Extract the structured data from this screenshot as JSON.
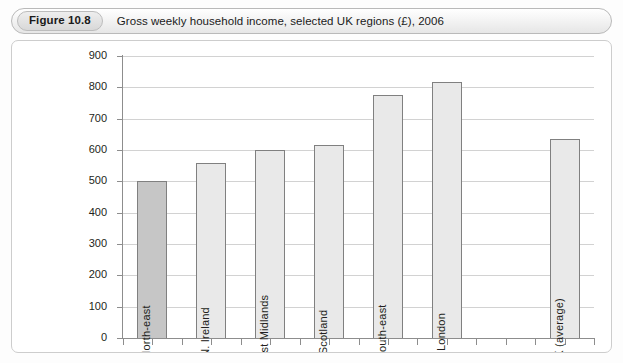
{
  "figure": {
    "tag": "Figure 10.8",
    "caption": "Gross weekly household income, selected UK regions (£), 2006"
  },
  "colors": {
    "bar_highlight_fill": "#c6c6c6",
    "bar_fill": "#e9e9e9",
    "bar_stroke": "#808080",
    "gridline": "#d2d2d2",
    "axis": "#8d8d8d",
    "text": "#231f20",
    "panel_border": "#cdcdcd"
  },
  "chart_data": {
    "type": "bar",
    "title": "Gross weekly household income, selected UK regions (£), 2006",
    "xlabel": "",
    "ylabel": "",
    "ylim": [
      0,
      900
    ],
    "ytick_step": 100,
    "yticks": [
      "900",
      "800",
      "700",
      "600",
      "500",
      "400",
      "300",
      "200",
      "100",
      "0"
    ],
    "grid": true,
    "legend": "none",
    "categories": [
      "North-east",
      "N. Ireland",
      "West Midlands",
      "Scotland",
      "South-east",
      "London",
      "",
      "UK (average)"
    ],
    "values": [
      500,
      560,
      600,
      615,
      775,
      818,
      null,
      635
    ],
    "bars": [
      {
        "label": "North-east",
        "value": 500,
        "highlight": true,
        "slot": 0
      },
      {
        "label": "N. Ireland",
        "value": 560,
        "highlight": false,
        "slot": 1
      },
      {
        "label": "West Midlands",
        "value": 600,
        "highlight": false,
        "slot": 2
      },
      {
        "label": "Scotland",
        "value": 615,
        "highlight": false,
        "slot": 3
      },
      {
        "label": "South-east",
        "value": 775,
        "highlight": false,
        "slot": 4
      },
      {
        "label": "London",
        "value": 818,
        "highlight": false,
        "slot": 5
      },
      {
        "label": "UK (average)",
        "value": 635,
        "highlight": false,
        "slot": 7
      }
    ]
  }
}
